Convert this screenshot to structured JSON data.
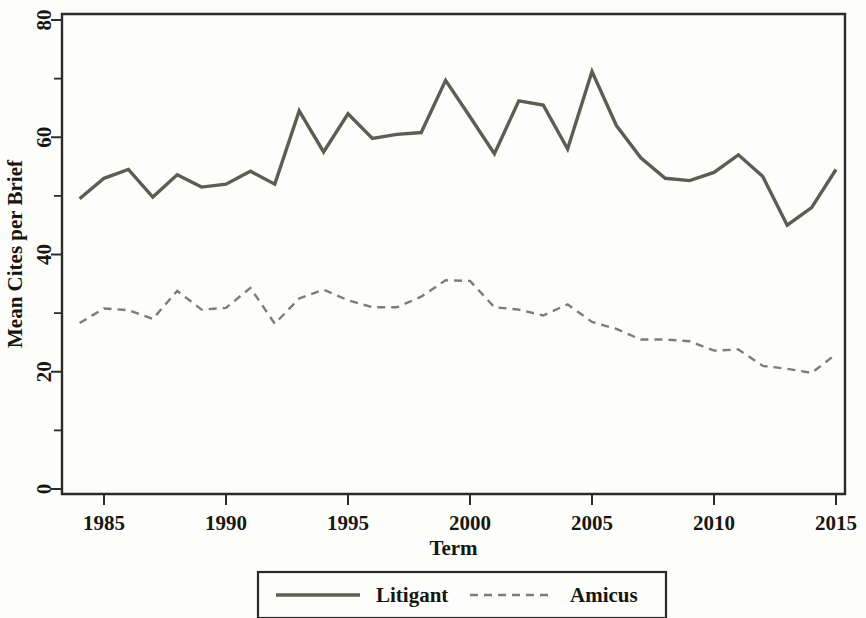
{
  "chart_data": {
    "type": "line",
    "title": "",
    "xlabel": "Term",
    "ylabel": "Mean Cites per Brief",
    "xlim": [
      1983.3,
      2015.4
    ],
    "ylim": [
      0,
      83
    ],
    "grid": false,
    "legend_position": "bottom-outside",
    "x_ticks": [
      1985,
      1990,
      1995,
      2000,
      2005,
      2010,
      2015
    ],
    "x_tick_labels": [
      "1985",
      "1990",
      "1995",
      "2000",
      "2005",
      "2010",
      "2015"
    ],
    "x_minor_ticks": [],
    "y_ticks": [
      0,
      20,
      40,
      60,
      80
    ],
    "y_tick_labels": [
      "0",
      "20",
      "40",
      "60",
      "80"
    ],
    "y_minor_ticks": [
      10,
      30,
      50,
      70
    ],
    "x": [
      1984,
      1985,
      1986,
      1987,
      1988,
      1989,
      1990,
      1991,
      1992,
      1993,
      1994,
      1995,
      1996,
      1997,
      1998,
      1999,
      2000,
      2001,
      2002,
      2003,
      2004,
      2005,
      2006,
      2007,
      2008,
      2009,
      2010,
      2011,
      2012,
      2013,
      2014,
      2015
    ],
    "series": [
      {
        "name": "Litigant",
        "style": "solid",
        "color": "#5d5d52",
        "width": 3.4,
        "values": [
          49.5,
          53.0,
          54.5,
          49.8,
          53.6,
          51.5,
          52.0,
          54.2,
          52.0,
          64.5,
          57.5,
          64.0,
          59.8,
          60.5,
          60.8,
          69.7,
          63.5,
          57.2,
          66.2,
          65.5,
          58.0,
          71.2,
          62.0,
          56.5,
          53.0,
          52.6,
          54.0,
          57.0,
          53.3,
          45.0,
          48.0,
          54.5
        ]
      },
      {
        "name": "Amicus",
        "style": "dashed",
        "color": "#7d7d70",
        "width": 2.4,
        "values": [
          28.3,
          30.8,
          30.5,
          29.0,
          33.8,
          30.6,
          30.9,
          34.3,
          28.2,
          32.5,
          34.0,
          32.2,
          31.0,
          31.0,
          32.8,
          35.6,
          35.5,
          31.0,
          30.6,
          29.6,
          31.5,
          28.5,
          27.3,
          25.5,
          25.5,
          25.2,
          23.6,
          23.8,
          21.0,
          20.5,
          19.8,
          23.0
        ]
      }
    ]
  },
  "legend": {
    "entries": [
      {
        "label": "Litigant",
        "style": "solid"
      },
      {
        "label": "Amicus",
        "style": "dashed"
      }
    ]
  }
}
